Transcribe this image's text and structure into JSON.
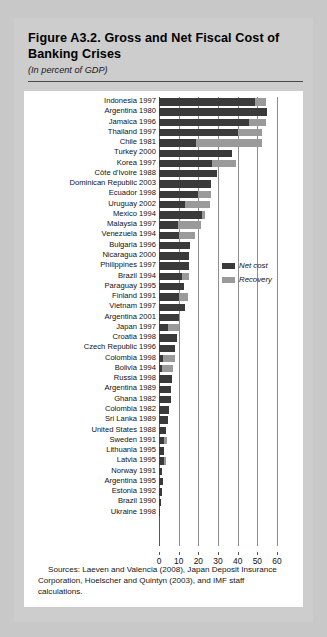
{
  "figure": {
    "title": "Figure A3.2.  Gross and Net Fiscal Cost of Banking Crises",
    "subtitle": "(In percent of GDP)",
    "source": "Sources:  Laeven and Valencia (2008), Japan Deposit Insurance Corporation, Hoelscher and Quintyn (2003), and IMF staff calculations."
  },
  "colors": {
    "net_cost": "#3a3a3a",
    "recovery": "#9a9a9a",
    "figure_background": "#cdcdcd",
    "panel_background": "#ffffff",
    "page_background": "#c8c8c8"
  },
  "chart_data": {
    "type": "bar",
    "orientation": "horizontal",
    "stacked": true,
    "title": "Figure A3.2.  Gross and Net Fiscal Cost of Banking Crises",
    "subtitle": "(In percent of GDP)",
    "xlabel": "",
    "ylabel": "",
    "xlim": [
      0,
      60
    ],
    "xticks": [
      0,
      10,
      20,
      30,
      40,
      50,
      60
    ],
    "xtick_labels": [
      "0",
      "10",
      "20",
      "30",
      "40",
      "50",
      "60"
    ],
    "grid": true,
    "legend_position": "middle-right",
    "legend": [
      "Net cost",
      "Recovery"
    ],
    "series": [
      {
        "name": "Net cost",
        "color": "#3a3a3a",
        "values": [
          49.0,
          55.1,
          46.0,
          40.0,
          19.0,
          37.0,
          27.0,
          29.5,
          26.3,
          19.6,
          13.3,
          22.0,
          9.6,
          10.4,
          16.0,
          15.2,
          15.2,
          11.8,
          12.8,
          10.4,
          13.3,
          10.4,
          4.4,
          9.0,
          8.0,
          2.0,
          1.7,
          6.8,
          6.0,
          6.0,
          5.0,
          4.6,
          3.8,
          2.4,
          2.6,
          2.4,
          1.6,
          1.8,
          1.4,
          0.8,
          0.6
        ]
      },
      {
        "name": "Recovery",
        "color": "#9a9a9a",
        "values": [
          5.5,
          0.0,
          8.5,
          12.6,
          33.6,
          0.0,
          12.0,
          0.0,
          0.0,
          7.1,
          12.4,
          1.3,
          11.9,
          7.9,
          0.0,
          0.0,
          0.0,
          3.4,
          0.0,
          4.2,
          0.0,
          0.0,
          6.0,
          0.0,
          0.0,
          6.0,
          5.3,
          0.0,
          0.0,
          0.0,
          0.0,
          0.0,
          0.0,
          1.6,
          0.0,
          1.4,
          0.0,
          0.0,
          0.0,
          0.0,
          0.0
        ]
      }
    ],
    "categories": [
      "Indonesia 1997",
      "Argentina 1980",
      "Jamaica 1996",
      "Thailand 1997",
      "Chile 1981",
      "Turkey 2000",
      "Korea 1997",
      "Côte d'Ivoire 1988",
      "Dominican Republic 2003",
      "Ecuador 1998",
      "Uruguay 2002",
      "Mexico 1994",
      "Malaysia 1997",
      "Venezuela 1994",
      "Bulgaria 1996",
      "Nicaragua 2000",
      "Philippines 1997",
      "Brazil 1994",
      "Paraguay 1995",
      "Finland 1991",
      "Vietnam 1997",
      "Argentina 2001",
      "Japan 1997",
      "Croatia 1998",
      "Czech Republic 1996",
      "Colombia 1998",
      "Bolivia 1994",
      "Russia 1998",
      "Argentina 1989",
      "Ghana 1982",
      "Colombia 1982",
      "Sri Lanka 1989",
      "United States 1988",
      "Sweden 1991",
      "Lithuania 1995",
      "Latvia 1995",
      "Norway 1991",
      "Argentina 1995",
      "Estonia 1992",
      "Brazil 1990",
      "Ukraine 1998"
    ]
  }
}
